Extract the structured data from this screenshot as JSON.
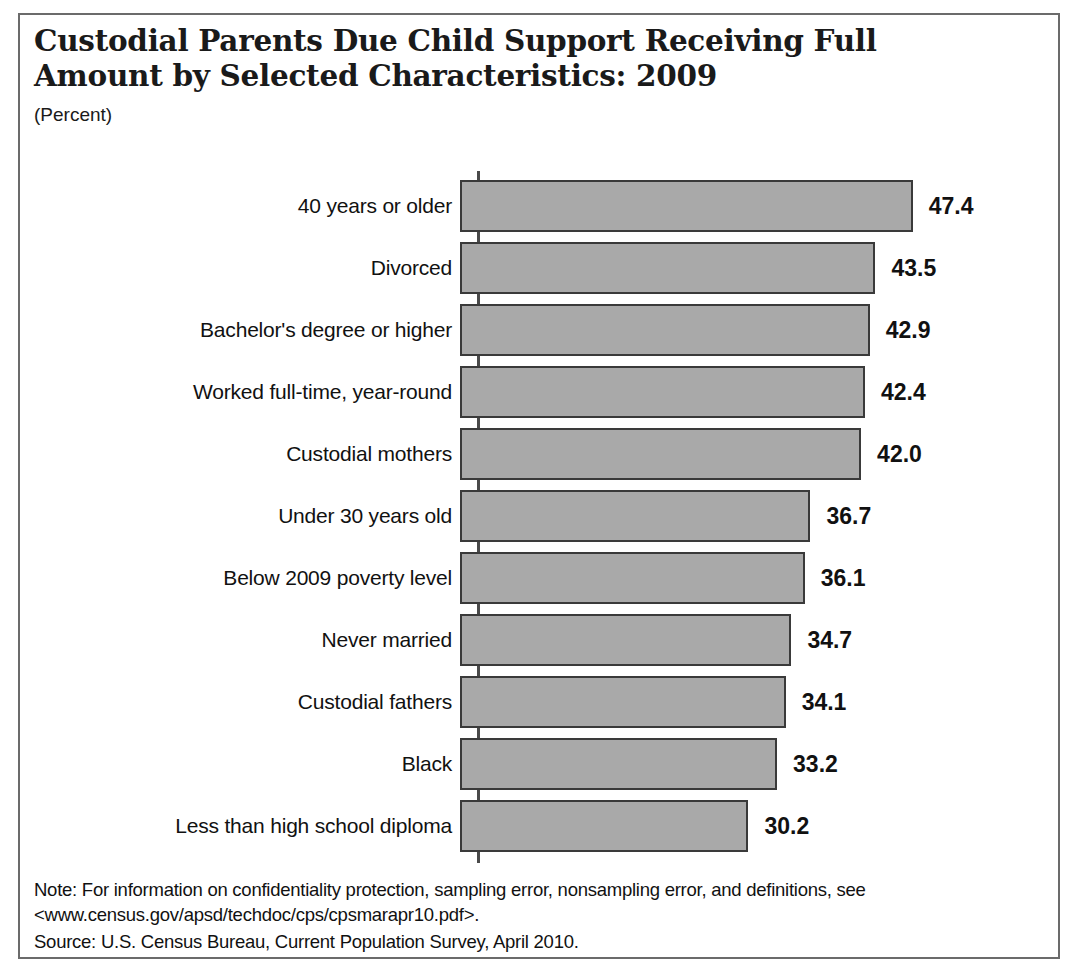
{
  "figure": {
    "title": "Custodial Parents Due Child Support Receiving Full\nAmount by Selected Characteristics: 2009",
    "subtitle": "(Percent)",
    "note": "Note: For information on confidentiality protection, sampling error, nonsampling error, and definitions, see <www.census.gov/apsd/techdoc/cps/cpsmarapr10.pdf>.",
    "source": "Source: U.S. Census Bureau, Current Population Survey, April 2010."
  },
  "colors": {
    "bar_fill": "#a9a9a9",
    "bar_border": "#3a3a3a",
    "frame_border": "#6b6b6b",
    "text": "#111111"
  },
  "chart_data": {
    "type": "bar",
    "orientation": "horizontal",
    "title": "Custodial Parents Due Child Support Receiving Full Amount by Selected Characteristics: 2009",
    "subtitle": "(Percent)",
    "xlabel": "",
    "ylabel": "",
    "xlim": [
      0,
      47.4
    ],
    "grid": false,
    "legend": false,
    "value_labels": true,
    "categories": [
      "40 years or older",
      "Divorced",
      "Bachelor's degree or higher",
      "Worked full-time, year-round",
      "Custodial mothers",
      "Under 30 years old",
      "Below 2009 poverty level",
      "Never married",
      "Custodial fathers",
      "Black",
      "Less than high school diploma"
    ],
    "values": [
      47.4,
      43.5,
      42.9,
      42.4,
      42.0,
      36.7,
      36.1,
      34.7,
      34.1,
      33.2,
      30.2
    ],
    "value_labels_text": [
      "47.4",
      "43.5",
      "42.9",
      "42.4",
      "42.0",
      "36.7",
      "36.1",
      "34.7",
      "34.1",
      "33.2",
      "30.2"
    ],
    "bars": [
      {
        "label": "40 years or older",
        "value": 47.4,
        "text": "47.4"
      },
      {
        "label": "Divorced",
        "value": 43.5,
        "text": "43.5"
      },
      {
        "label": "Bachelor's degree or higher",
        "value": 42.9,
        "text": "42.9"
      },
      {
        "label": "Worked full-time, year-round",
        "value": 42.4,
        "text": "42.4"
      },
      {
        "label": "Custodial mothers",
        "value": 42.0,
        "text": "42.0"
      },
      {
        "label": "Under 30 years old",
        "value": 36.7,
        "text": "36.7"
      },
      {
        "label": "Below 2009 poverty level",
        "value": 36.1,
        "text": "36.1"
      },
      {
        "label": "Never married",
        "value": 34.7,
        "text": "34.7"
      },
      {
        "label": "Custodial fathers",
        "value": 34.1,
        "text": "34.1"
      },
      {
        "label": "Black",
        "value": 33.2,
        "text": "33.2"
      },
      {
        "label": "Less than high school diploma",
        "value": 30.2,
        "text": "30.2"
      }
    ]
  }
}
